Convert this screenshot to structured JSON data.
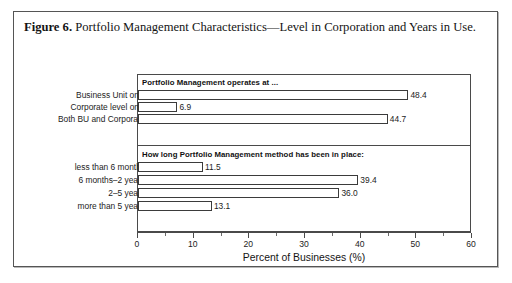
{
  "figure": {
    "label": "Figure 6.",
    "caption": " Portfolio Management Characteristics—Level in Corporation and Years in Use."
  },
  "chart_data": {
    "type": "bar",
    "orientation": "horizontal",
    "title": "Portfolio Management Characteristics—Level in Corporation and Years in Use.",
    "xlabel": "Percent of Businesses (%)",
    "ylabel": "",
    "xlim": [
      0,
      60
    ],
    "xticks": [
      0,
      10,
      20,
      30,
      40,
      50,
      60
    ],
    "xtick_labels": [
      "0",
      "10",
      "20",
      "30",
      "40",
      "50",
      "60"
    ],
    "minor_tick_interval": 5,
    "grid": false,
    "legend": false,
    "panels": [
      {
        "heading": "Portfolio Management operates at ...",
        "categories": [
          "Business Unit only",
          "Corporate level only",
          "Both BU and Corporate"
        ],
        "values": [
          48.4,
          6.9,
          44.7
        ],
        "value_labels": [
          "48.4",
          "6.9",
          "44.7"
        ]
      },
      {
        "heading": "How long Portfolio Management method has been in place:",
        "categories": [
          "less than 6 months",
          "6 months–2 years",
          "2–5 years",
          "more than 5 years"
        ],
        "values": [
          11.5,
          39.4,
          36.0,
          13.1
        ],
        "value_labels": [
          "11.5",
          "39.4",
          "36.0",
          "13.1"
        ]
      }
    ]
  },
  "colors": {
    "bar_fill": "#ffffff",
    "bar_stroke": "#3b3b3b",
    "axis": "#4a4a4a",
    "frame": "#555555",
    "text": "#1a1a1a",
    "background": "#ffffff"
  }
}
